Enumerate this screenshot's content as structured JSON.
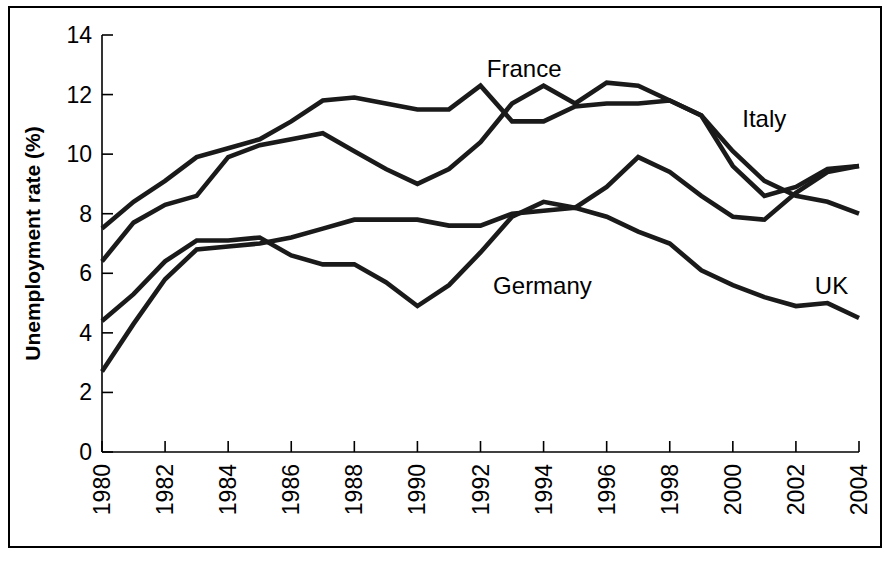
{
  "figure": {
    "background_color": "#ffffff",
    "line_color": "#1a1a1a",
    "axis_color": "#000000",
    "frame": true
  },
  "chart_data": {
    "type": "line",
    "title": "",
    "xlabel": "Year",
    "ylabel": "Unemployment rate (%)",
    "xlim": [
      1980,
      2004
    ],
    "ylim": [
      0,
      14
    ],
    "yticks": [
      0,
      2,
      4,
      6,
      8,
      10,
      12,
      14
    ],
    "ytick_labels": [
      "0",
      "2",
      "4",
      "6",
      "8",
      "10",
      "12",
      "14"
    ],
    "xticks": [
      1980,
      1982,
      1984,
      1986,
      1988,
      1990,
      1992,
      1994,
      1996,
      1998,
      2000,
      2002,
      2004
    ],
    "xtick_labels": [
      "1980",
      "1982",
      "1984",
      "1986",
      "1988",
      "1990",
      "1992",
      "1994",
      "1996",
      "1998",
      "2000",
      "2002",
      "2004"
    ],
    "xtick_rotation": 90,
    "grid": false,
    "legend": "inline-labels",
    "x": [
      1980,
      1981,
      1982,
      1983,
      1984,
      1985,
      1986,
      1987,
      1988,
      1989,
      1990,
      1991,
      1992,
      1993,
      1994,
      1995,
      1996,
      1997,
      1998,
      1999,
      2000,
      2001,
      2002,
      2003,
      2004
    ],
    "series": [
      {
        "name": "France",
        "label": "France",
        "label_x": 1992.2,
        "label_y": 12.6,
        "values": [
          6.4,
          7.7,
          8.3,
          8.6,
          9.9,
          10.3,
          10.5,
          10.7,
          10.1,
          9.5,
          9.0,
          9.5,
          10.4,
          11.7,
          12.3,
          11.7,
          12.4,
          12.3,
          11.8,
          11.3,
          9.6,
          8.6,
          8.9,
          9.5,
          9.6
        ],
        "color": "#1a1a1a"
      },
      {
        "name": "Italy",
        "label": "Italy",
        "label_x": 2000.3,
        "label_y": 10.9,
        "values": [
          7.5,
          8.4,
          9.1,
          9.9,
          10.2,
          10.5,
          11.1,
          11.8,
          11.9,
          11.7,
          11.5,
          11.5,
          12.3,
          11.1,
          11.1,
          11.6,
          11.7,
          11.7,
          11.8,
          11.3,
          10.1,
          9.1,
          8.6,
          8.4,
          8.0
        ],
        "color": "#1a1a1a"
      },
      {
        "name": "Germany",
        "label": "Germany",
        "label_x": 1992.4,
        "label_y": 5.3,
        "values": [
          4.4,
          5.3,
          6.4,
          7.1,
          7.1,
          7.2,
          6.6,
          6.3,
          6.3,
          5.7,
          4.9,
          5.6,
          6.7,
          7.9,
          8.4,
          8.2,
          8.9,
          9.9,
          9.4,
          8.6,
          7.9,
          7.8,
          8.7,
          9.4,
          9.6
        ],
        "color": "#1a1a1a"
      },
      {
        "name": "UK",
        "label": "UK",
        "label_x": 2002.6,
        "label_y": 5.3,
        "values": [
          2.7,
          4.3,
          5.8,
          6.8,
          6.9,
          7.0,
          7.2,
          7.5,
          7.8,
          7.8,
          7.8,
          7.6,
          7.6,
          8.0,
          8.1,
          8.2,
          7.9,
          7.4,
          7.0,
          6.1,
          5.6,
          5.2,
          4.9,
          5.0,
          4.5
        ],
        "color": "#1a1a1a"
      }
    ]
  }
}
